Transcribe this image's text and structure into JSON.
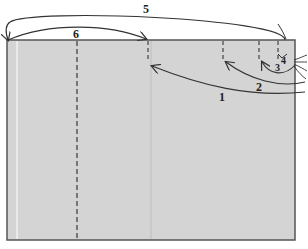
{
  "diagram": {
    "type": "folding-sequence",
    "panel": {
      "fill": "#d4d4d4",
      "stroke": "#555555"
    },
    "fold_lines": [
      {
        "id": "fold-6",
        "x": 77,
        "style": "dashed"
      },
      {
        "id": "fold-a",
        "x": 148,
        "style": "dashed-short"
      },
      {
        "id": "fold-b",
        "x": 223,
        "style": "dashed-short"
      },
      {
        "id": "fold-c",
        "x": 259,
        "style": "dashed-short"
      },
      {
        "id": "fold-d",
        "x": 278,
        "style": "dashed-short"
      }
    ],
    "arrows": [
      {
        "label": "1",
        "desc": "fold right edge to first dashed line at left"
      },
      {
        "label": "2",
        "desc": "fold right edge to mid-right dashed line"
      },
      {
        "label": "3",
        "desc": "fold right edge to near-right dashed line"
      },
      {
        "label": "4",
        "desc": "small fold at top right corner"
      },
      {
        "label": "5",
        "desc": "fold top-right across to left edge"
      },
      {
        "label": "6",
        "desc": "fold left segment over to center"
      }
    ],
    "labels": {
      "l1": "1",
      "l2": "2",
      "l3": "3",
      "l4": "4",
      "l5": "5",
      "l6": "6"
    }
  }
}
